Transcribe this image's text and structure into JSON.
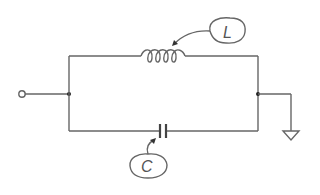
{
  "diagram": {
    "type": "circuit-schematic",
    "components": [
      {
        "id": "L",
        "kind": "inductor",
        "label": "L",
        "position": "top-branch"
      },
      {
        "id": "C",
        "kind": "capacitor",
        "label": "C",
        "position": "bottom-branch"
      }
    ],
    "terminals": [
      {
        "id": "input",
        "kind": "open-terminal",
        "position": "left"
      },
      {
        "id": "ground",
        "kind": "ground",
        "position": "right"
      }
    ],
    "nodes": [
      {
        "id": "left-junction"
      },
      {
        "id": "right-junction"
      }
    ],
    "connections": [
      [
        "input",
        "left-junction"
      ],
      [
        "left-junction",
        "L"
      ],
      [
        "left-junction",
        "C"
      ],
      [
        "L",
        "right-junction"
      ],
      [
        "C",
        "right-junction"
      ],
      [
        "right-junction",
        "ground"
      ]
    ],
    "colors": {
      "wire": "#666666",
      "background": "#ffffff"
    }
  }
}
